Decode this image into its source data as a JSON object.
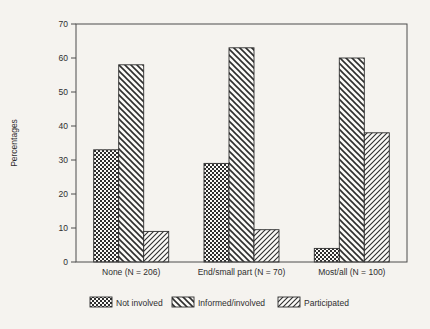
{
  "figure": {
    "background": "#f5f3ef",
    "paper_white": "#fbfaf7",
    "ink": "#2e2e2e",
    "frame_color": "#4d4d4d"
  },
  "chart_data": {
    "type": "bar",
    "title": "",
    "xlabel": "",
    "ylabel": "Percentages",
    "ylim": [
      0,
      70
    ],
    "yticks": [
      0,
      10,
      20,
      30,
      40,
      50,
      60,
      70
    ],
    "grid": false,
    "frame": true,
    "legend_position": "bottom",
    "categories": [
      "None (N = 206)",
      "End/small part (N = 70)",
      "Most/all (N = 100)"
    ],
    "series": [
      {
        "name": "Not involved",
        "pattern": "checkerboard",
        "values": [
          33,
          29,
          4
        ]
      },
      {
        "name": "Informed/involved",
        "pattern": "diagonal-backslash",
        "values": [
          58,
          63,
          60
        ]
      },
      {
        "name": "Participated",
        "pattern": "diagonal-slash",
        "values": [
          9,
          9.5,
          38
        ]
      }
    ]
  }
}
